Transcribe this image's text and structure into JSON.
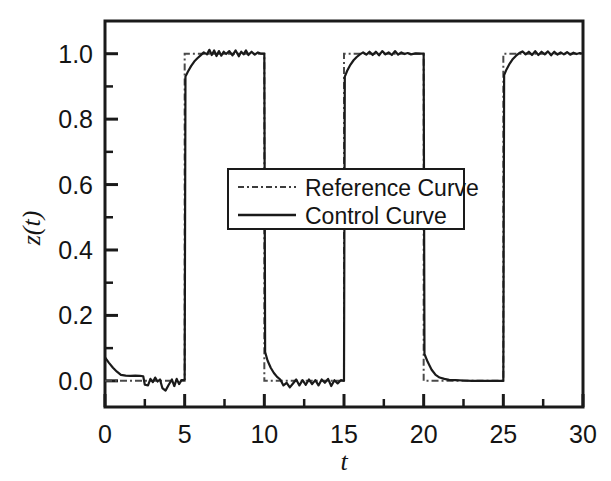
{
  "chart_data": {
    "type": "line",
    "title": "",
    "subtitle": "",
    "xlabel": "t",
    "ylabel": "z(t)",
    "xlim": [
      0,
      30
    ],
    "ylim": [
      -0.08,
      1.1
    ],
    "xticks": [
      0,
      5,
      10,
      15,
      20,
      25,
      30
    ],
    "xticklabels": [
      "0",
      "5",
      "10",
      "15",
      "20",
      "25",
      "30"
    ],
    "xminorticks": [
      2.5,
      7.5,
      12.5,
      17.5,
      22.5,
      27.5
    ],
    "yticks": [
      0.0,
      0.2,
      0.4,
      0.6,
      0.8,
      1.0
    ],
    "yticklabels": [
      "0.0",
      "0.2",
      "0.4",
      "0.6",
      "0.8",
      "1.0"
    ],
    "yminorticks": [
      0.1,
      0.3,
      0.5,
      0.7,
      0.9
    ],
    "grid": false,
    "frame": "box",
    "legend_position": "center",
    "legend_entries": [
      {
        "label": "Reference Curve",
        "style": "dash-dot",
        "color": "#3c3c3c"
      },
      {
        "label": "Control Curve",
        "style": "solid",
        "color": "#1a1a1a"
      }
    ],
    "series": [
      {
        "name": "Reference Curve",
        "style": "dash-dot",
        "color": "#4a4a4a",
        "description": "Ideal square wave: 0 for t in [0,5), 1 for [5,10), 0 for [10,15), 1 for [15,20), 0 for [20,25), 1 for [25,30]",
        "points": [
          [
            0,
            0
          ],
          [
            5,
            0
          ],
          [
            5,
            1
          ],
          [
            10,
            1
          ],
          [
            10,
            0
          ],
          [
            15,
            0
          ],
          [
            15,
            1
          ],
          [
            20,
            1
          ],
          [
            20,
            0
          ],
          [
            25,
            0
          ],
          [
            25,
            1
          ],
          [
            30,
            1
          ]
        ]
      },
      {
        "name": "Control Curve",
        "style": "solid",
        "color": "#1a1a1a",
        "description": "Noisy tracking response to the square reference with transient overshoot at each edge",
        "points": [
          [
            0.0,
            0.072
          ],
          [
            0.25,
            0.055
          ],
          [
            0.5,
            0.04
          ],
          [
            0.75,
            0.028
          ],
          [
            1.0,
            0.018
          ],
          [
            1.3,
            0.016
          ],
          [
            1.6,
            0.015
          ],
          [
            1.9,
            0.016
          ],
          [
            2.2,
            0.015
          ],
          [
            2.4,
            0.014
          ],
          [
            2.5,
            -0.012
          ],
          [
            2.7,
            -0.014
          ],
          [
            2.85,
            0.006
          ],
          [
            3.0,
            -0.004
          ],
          [
            3.15,
            0.01
          ],
          [
            3.3,
            -0.002
          ],
          [
            3.45,
            0.004
          ],
          [
            3.6,
            -0.022
          ],
          [
            3.8,
            -0.03
          ],
          [
            4.0,
            -0.012
          ],
          [
            4.2,
            0.004
          ],
          [
            4.35,
            -0.016
          ],
          [
            4.5,
            0.006
          ],
          [
            4.65,
            -0.01
          ],
          [
            4.8,
            0.002
          ],
          [
            4.95,
            0.002
          ],
          [
            5.0,
            0.004
          ],
          [
            5.05,
            0.93
          ],
          [
            5.2,
            0.945
          ],
          [
            5.4,
            0.962
          ],
          [
            5.6,
            0.976
          ],
          [
            5.8,
            0.986
          ],
          [
            6.0,
            0.995
          ],
          [
            6.2,
            1.004
          ],
          [
            6.4,
            0.998
          ],
          [
            6.55,
            1.012
          ],
          [
            6.7,
            0.996
          ],
          [
            6.85,
            1.01
          ],
          [
            7.0,
            0.993
          ],
          [
            7.15,
            1.008
          ],
          [
            7.3,
            0.994
          ],
          [
            7.45,
            1.006
          ],
          [
            7.6,
            0.999
          ],
          [
            7.8,
            1.008
          ],
          [
            8.0,
            0.995
          ],
          [
            8.2,
            1.01
          ],
          [
            8.4,
            0.992
          ],
          [
            8.55,
            1.006
          ],
          [
            8.7,
            0.998
          ],
          [
            8.85,
            1.01
          ],
          [
            9.0,
            0.996
          ],
          [
            9.2,
            1.006
          ],
          [
            9.4,
            0.997
          ],
          [
            9.6,
            1.004
          ],
          [
            9.8,
            1.0
          ],
          [
            9.95,
            1.0
          ],
          [
            10.0,
            1.0
          ],
          [
            10.05,
            0.088
          ],
          [
            10.2,
            0.062
          ],
          [
            10.4,
            0.04
          ],
          [
            10.6,
            0.024
          ],
          [
            10.8,
            0.012
          ],
          [
            11.0,
            0.004
          ],
          [
            11.2,
            -0.014
          ],
          [
            11.4,
            -0.006
          ],
          [
            11.6,
            -0.02
          ],
          [
            11.8,
            -0.008
          ],
          [
            12.0,
            0.004
          ],
          [
            12.2,
            -0.014
          ],
          [
            12.4,
            0.002
          ],
          [
            12.6,
            -0.012
          ],
          [
            12.8,
            0.004
          ],
          [
            13.0,
            -0.01
          ],
          [
            13.2,
            0.002
          ],
          [
            13.4,
            -0.014
          ],
          [
            13.6,
            0.004
          ],
          [
            13.8,
            -0.006
          ],
          [
            14.0,
            0.006
          ],
          [
            14.2,
            -0.016
          ],
          [
            14.4,
            0.002
          ],
          [
            14.6,
            -0.008
          ],
          [
            14.8,
            0.002
          ],
          [
            15.0,
            0.0
          ],
          [
            15.05,
            0.93
          ],
          [
            15.2,
            0.948
          ],
          [
            15.4,
            0.966
          ],
          [
            15.6,
            0.98
          ],
          [
            15.8,
            0.99
          ],
          [
            16.0,
            0.998
          ],
          [
            16.2,
            1.004
          ],
          [
            16.4,
            0.997
          ],
          [
            16.6,
            1.006
          ],
          [
            16.8,
            0.996
          ],
          [
            17.0,
            1.006
          ],
          [
            17.2,
            0.995
          ],
          [
            17.4,
            1.008
          ],
          [
            17.6,
            0.998
          ],
          [
            17.8,
            1.004
          ],
          [
            18.0,
            0.996
          ],
          [
            18.2,
            1.008
          ],
          [
            18.4,
            0.997
          ],
          [
            18.6,
            1.004
          ],
          [
            18.8,
            0.999
          ],
          [
            19.0,
            1.002
          ],
          [
            19.2,
            0.998
          ],
          [
            19.5,
            1.001
          ],
          [
            19.8,
            1.0
          ],
          [
            20.0,
            1.0
          ],
          [
            20.05,
            0.082
          ],
          [
            20.25,
            0.058
          ],
          [
            20.5,
            0.034
          ],
          [
            20.75,
            0.018
          ],
          [
            21.0,
            0.01
          ],
          [
            21.3,
            0.006
          ],
          [
            21.6,
            0.003
          ],
          [
            22.0,
            0.002
          ],
          [
            22.5,
            0.001
          ],
          [
            23.0,
            0.0
          ],
          [
            24.0,
            0.0
          ],
          [
            25.0,
            0.0
          ],
          [
            25.05,
            0.935
          ],
          [
            25.2,
            0.952
          ],
          [
            25.4,
            0.97
          ],
          [
            25.6,
            0.984
          ],
          [
            25.8,
            0.994
          ],
          [
            26.0,
            1.002
          ],
          [
            26.2,
            1.007
          ],
          [
            26.4,
            0.998
          ],
          [
            26.6,
            1.006
          ],
          [
            26.8,
            0.996
          ],
          [
            27.0,
            1.008
          ],
          [
            27.2,
            0.996
          ],
          [
            27.4,
            1.006
          ],
          [
            27.6,
            0.998
          ],
          [
            27.8,
            1.007
          ],
          [
            28.0,
            0.995
          ],
          [
            28.2,
            1.006
          ],
          [
            28.4,
            0.997
          ],
          [
            28.6,
            1.004
          ],
          [
            28.8,
            0.998
          ],
          [
            29.0,
            1.005
          ],
          [
            29.2,
            0.997
          ],
          [
            29.4,
            1.003
          ],
          [
            29.6,
            0.999
          ],
          [
            29.8,
            1.002
          ],
          [
            30.0,
            1.0
          ]
        ]
      }
    ]
  },
  "axes": {
    "y_title": "z(t)",
    "y_title_var": "z",
    "y_title_arg": "t",
    "x_title": "t"
  }
}
